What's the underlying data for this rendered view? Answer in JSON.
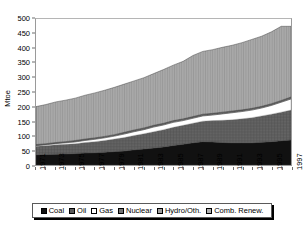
{
  "chart_data": {
    "type": "area",
    "title": "",
    "xlabel": "",
    "ylabel": "Mtoe",
    "ylim": [
      0,
      500
    ],
    "ytick_step": 50,
    "yticks": [
      0,
      50,
      100,
      150,
      200,
      250,
      300,
      350,
      400,
      450,
      500
    ],
    "grid": false,
    "legend_position": "bottom",
    "stacked": true,
    "x": [
      1971,
      1972,
      1973,
      1974,
      1975,
      1976,
      1977,
      1978,
      1979,
      1980,
      1981,
      1982,
      1983,
      1984,
      1985,
      1986,
      1987,
      1988,
      1989,
      1990,
      1991,
      1992,
      1993,
      1994,
      1995,
      1996,
      1997
    ],
    "xtick_labels": [
      "1971",
      "1973",
      "1975",
      "1977",
      "1979",
      "1981",
      "1983",
      "1985",
      "1987",
      "1989",
      "1991",
      "1993",
      "1995",
      "1997"
    ],
    "categories": [
      "1971",
      "1972",
      "1973",
      "1974",
      "1975",
      "1976",
      "1977",
      "1978",
      "1979",
      "1980",
      "1981",
      "1982",
      "1983",
      "1984",
      "1985",
      "1986",
      "1987",
      "1988",
      "1989",
      "1990",
      "1991",
      "1992",
      "1993",
      "1994",
      "1995",
      "1996",
      "1997"
    ],
    "series": [
      {
        "name": "Coal",
        "color": "#111111",
        "pattern": "solid",
        "values": [
          35,
          36,
          37,
          38,
          39,
          41,
          42,
          44,
          46,
          48,
          52,
          55,
          58,
          62,
          67,
          71,
          76,
          80,
          79,
          77,
          76,
          76,
          76,
          78,
          80,
          83,
          86
        ]
      },
      {
        "name": "Oil",
        "color": "#5a5a5a",
        "pattern": "cross-hatch",
        "values": [
          29,
          30,
          32,
          33,
          34,
          36,
          38,
          40,
          43,
          46,
          49,
          52,
          56,
          59,
          62,
          65,
          67,
          70,
          73,
          76,
          79,
          82,
          86,
          90,
          94,
          98,
          102
        ]
      },
      {
        "name": "Gas",
        "color": "#ffffff",
        "pattern": "none",
        "values": [
          2,
          3,
          4,
          5,
          6,
          7,
          8,
          9,
          10,
          12,
          13,
          14,
          16,
          16,
          17,
          16,
          17,
          18,
          19,
          22,
          24,
          25,
          26,
          27,
          30,
          34,
          38
        ]
      },
      {
        "name": "Nuclear",
        "color": "#6b6b6b",
        "pattern": "fine-hatch",
        "values": [
          3,
          3,
          3,
          3,
          4,
          4,
          4,
          4,
          4,
          5,
          5,
          5,
          5,
          5,
          5,
          5,
          5,
          5,
          5,
          5,
          5,
          5,
          5,
          5,
          5,
          5,
          6
        ]
      },
      {
        "name": "Hydro/Oth.",
        "color": "#9c9c9c",
        "pattern": "vertical-line",
        "values": [
          1,
          1,
          1,
          1,
          1,
          1,
          1,
          1,
          1,
          1,
          1,
          1,
          1,
          1,
          1,
          1,
          1,
          1,
          1,
          1,
          1,
          1,
          1,
          1,
          1,
          1,
          1
        ]
      },
      {
        "name": "Comb. Renew.",
        "color": "#adadad",
        "pattern": "vertical-line",
        "values": [
          130,
          134,
          139,
          142,
          145,
          150,
          154,
          158,
          162,
          165,
          168,
          172,
          177,
          184,
          190,
          197,
          209,
          215,
          218,
          222,
          225,
          230,
          236,
          240,
          246,
          254,
          242
        ]
      }
    ],
    "totals": [
      200,
      207,
      216,
      222,
      229,
      239,
      247,
      256,
      266,
      277,
      288,
      299,
      313,
      327,
      342,
      355,
      375,
      389,
      395,
      403,
      410,
      419,
      430,
      441,
      456,
      475,
      475
    ]
  },
  "legend": {
    "items": [
      {
        "label": "Coal"
      },
      {
        "label": "Oil"
      },
      {
        "label": "Gas"
      },
      {
        "label": "Nuclear"
      },
      {
        "label": "Hydro/Oth."
      },
      {
        "label": "Comb. Renew."
      }
    ]
  }
}
